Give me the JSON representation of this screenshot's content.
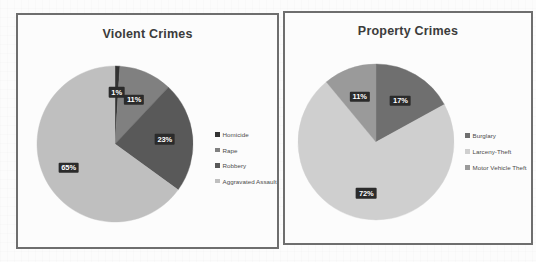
{
  "background": {
    "page_color": "#fcfcfc"
  },
  "chart_data": [
    {
      "type": "pie",
      "title": "Violent Crimes",
      "categories": [
        "Homicide",
        "Rape",
        "Robbery",
        "Aggravated Assault"
      ],
      "values": [
        1,
        11,
        23,
        65
      ],
      "value_labels": [
        "1%",
        "11%",
        "23%",
        "65%"
      ],
      "colors": [
        "#333333",
        "#808080",
        "#595959",
        "#bfbfbf"
      ],
      "legend_position": "right",
      "grid": false
    },
    {
      "type": "pie",
      "title": "Property Crimes",
      "categories": [
        "Burglary",
        "Larceny-Theft",
        "Motor Vehicle Theft"
      ],
      "values": [
        17,
        72,
        11
      ],
      "value_labels": [
        "17%",
        "72%",
        "11%"
      ],
      "colors": [
        "#6f6f6f",
        "#cfcfcf",
        "#9a9a9a"
      ],
      "legend_position": "right",
      "grid": false
    }
  ],
  "charts": {
    "violent": {
      "title": "Violent Crimes",
      "legend": [
        {
          "label": "Homicide",
          "color": "#333333"
        },
        {
          "label": "Rape",
          "color": "#808080"
        },
        {
          "label": "Robbery",
          "color": "#595959"
        },
        {
          "label": "Aggravated Assault",
          "color": "#bfbfbf"
        }
      ],
      "slices": [
        {
          "label": "Homicide",
          "pct": "1%",
          "value": 1,
          "color": "#333333"
        },
        {
          "label": "Rape",
          "pct": "11%",
          "value": 11,
          "color": "#808080"
        },
        {
          "label": "Robbery",
          "pct": "23%",
          "value": 23,
          "color": "#595959"
        },
        {
          "label": "Aggravated Assault",
          "pct": "65%",
          "value": 65,
          "color": "#bfbfbf"
        }
      ]
    },
    "property": {
      "title": "Property Crimes",
      "legend": [
        {
          "label": "Burglary",
          "color": "#6f6f6f"
        },
        {
          "label": "Larceny-Theft",
          "color": "#cfcfcf"
        },
        {
          "label": "Motor Vehicle Theft",
          "color": "#9a9a9a"
        }
      ],
      "slices": [
        {
          "label": "Burglary",
          "pct": "17%",
          "value": 17,
          "color": "#6f6f6f"
        },
        {
          "label": "Larceny-Theft",
          "pct": "72%",
          "value": 72,
          "color": "#cfcfcf"
        },
        {
          "label": "Motor Vehicle Theft",
          "pct": "11%",
          "value": 11,
          "color": "#9a9a9a"
        }
      ]
    }
  }
}
